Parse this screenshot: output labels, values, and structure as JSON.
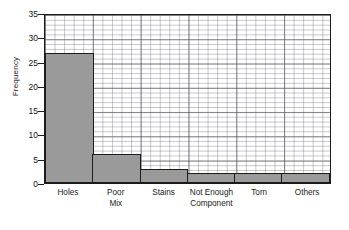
{
  "chart_data": {
    "type": "bar",
    "title": "",
    "xlabel": "",
    "ylabel": "Frequency",
    "categories": [
      "Holes",
      "Poor Mix",
      "Stains",
      "Not Enough Component",
      "Torn",
      "Others"
    ],
    "category_lines": [
      [
        "Holes"
      ],
      [
        "Poor",
        "Mix"
      ],
      [
        "Stains"
      ],
      [
        "Not Enough",
        "Component"
      ],
      [
        "Torn"
      ],
      [
        "Others"
      ]
    ],
    "values": [
      27,
      6,
      3,
      2,
      2,
      2
    ],
    "ylim": [
      0,
      35
    ],
    "ytick_labels": [
      "35",
      "30",
      "25",
      "20",
      "15",
      "10",
      "5",
      "0"
    ],
    "ytick_values": [
      35,
      30,
      25,
      20,
      15,
      10,
      5,
      0
    ],
    "ytick_step": 5,
    "grid": true,
    "grid_minor_divisions": 5,
    "legend": "none",
    "bar_fill_color": "#9a9a9a",
    "bar_edge_color": "#1c1c1c",
    "plot_background_color": "#ffffff",
    "axis_color": "#1c1c1c"
  }
}
